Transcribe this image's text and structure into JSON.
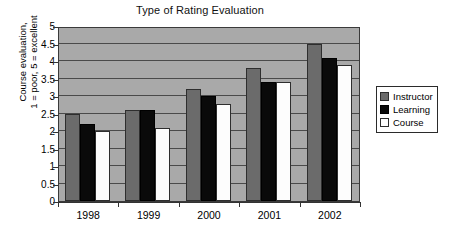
{
  "chart_data": {
    "type": "bar",
    "title": "Type of Rating Evaluation",
    "xlabel": "",
    "ylabel": "Course evaluation, 1 = poor, 5 = excellent",
    "ylabel_lines": [
      "Course evaluation,",
      "1 = poor, 5 = excellent"
    ],
    "categories": [
      "1998",
      "1999",
      "2000",
      "2001",
      "2002"
    ],
    "series": [
      {
        "name": "Instructor",
        "color": "#6b6b6b",
        "values": [
          2.5,
          2.6,
          3.2,
          3.8,
          4.5
        ]
      },
      {
        "name": "Learning",
        "color": "#0a0a0a",
        "values": [
          2.2,
          2.6,
          3.0,
          3.4,
          4.1
        ]
      },
      {
        "name": "Course",
        "color": "#ffffff",
        "values": [
          2.0,
          2.1,
          2.78,
          3.4,
          3.9
        ]
      }
    ],
    "ylim": [
      0,
      5
    ],
    "ytick_values": [
      0,
      0.5,
      1,
      1.5,
      2,
      2.5,
      3,
      3.5,
      4,
      4.5,
      5
    ],
    "ytick_labels": [
      "0",
      "0.5",
      "1",
      "1.5",
      "2",
      "2.5",
      "3",
      "3.5",
      "4",
      "4.5",
      "5"
    ],
    "grid": true,
    "legend_position": "right",
    "plot_background": "#a9a9a9",
    "gridline_color": "#4a4a4a"
  }
}
